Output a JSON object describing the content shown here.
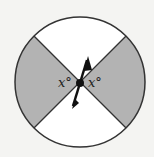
{
  "diagram": {
    "type": "spinner",
    "labels": {
      "left_angle": "x°",
      "right_angle": "x°"
    },
    "colors": {
      "shaded": "#b3b3b3",
      "unshaded": "#ffffff",
      "stroke": "#333333"
    },
    "sectors": [
      {
        "position": "top",
        "shaded": false
      },
      {
        "position": "right",
        "shaded": true
      },
      {
        "position": "bottom",
        "shaded": false
      },
      {
        "position": "left",
        "shaded": true
      }
    ]
  }
}
